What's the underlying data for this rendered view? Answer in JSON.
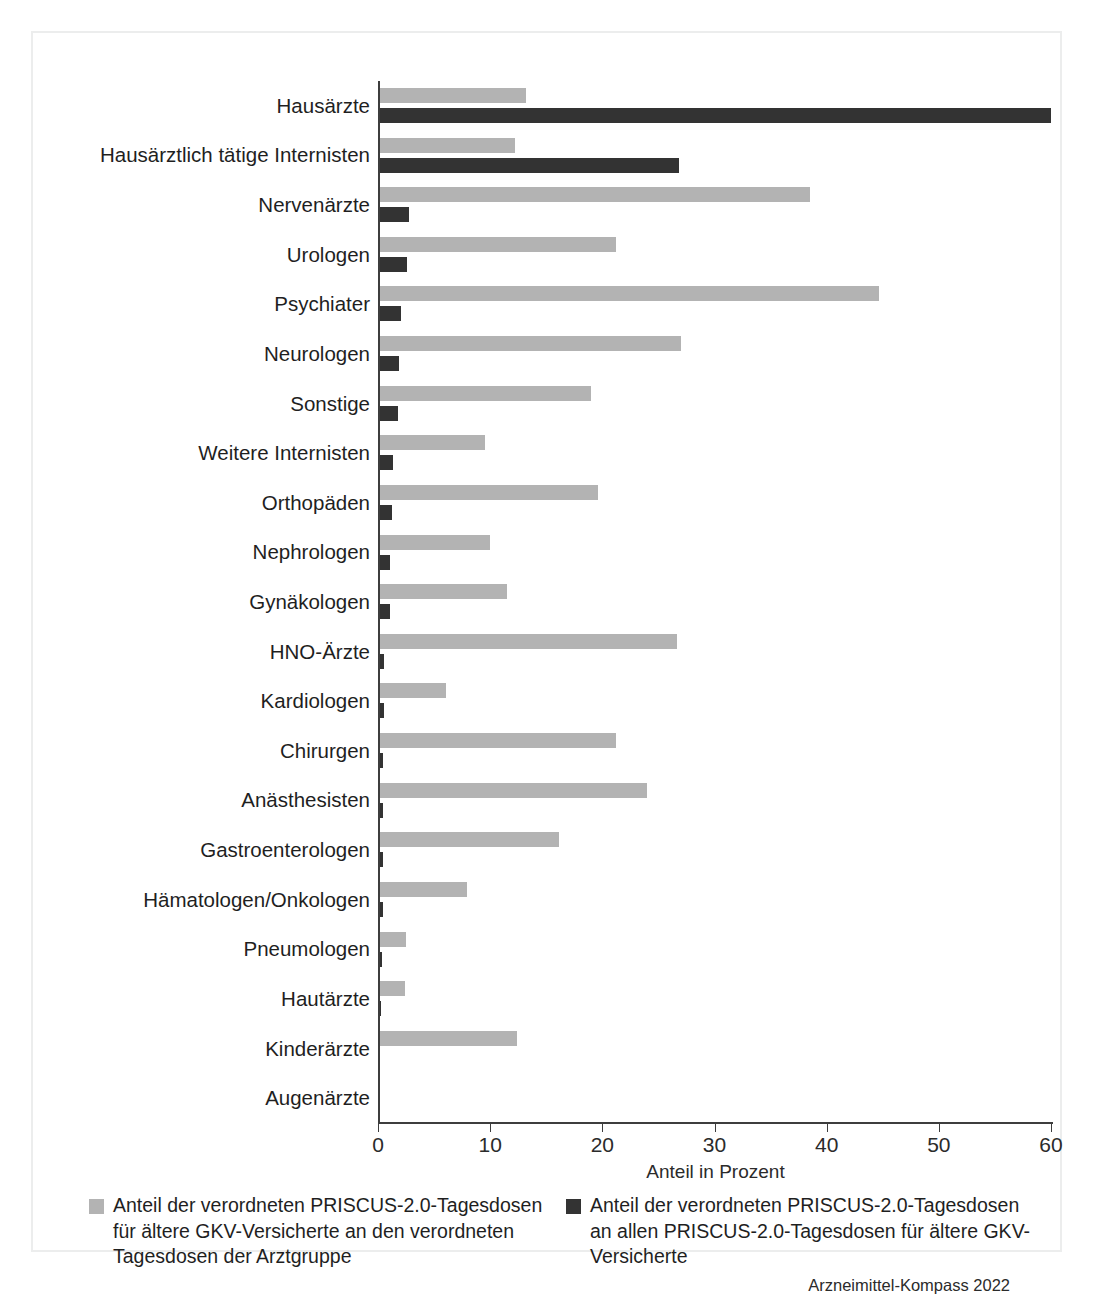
{
  "chart_data": {
    "type": "bar",
    "orientation": "horizontal",
    "title": "",
    "xlabel": "Anteil in Prozent",
    "ylabel": "",
    "xlim": [
      0,
      60
    ],
    "xticks": [
      0,
      10,
      20,
      30,
      40,
      50,
      60
    ],
    "grid": false,
    "legend_position": "bottom",
    "categories": [
      "Hausärzte",
      "Hausärztlich tätige Internisten",
      "Nervenärzte",
      "Urologen",
      "Psychiater",
      "Neurologen",
      "Sonstige",
      "Weitere Internisten",
      "Orthopäden",
      "Nephrologen",
      "Gynäkologen",
      "HNO-Ärzte",
      "Kardiologen",
      "Chirurgen",
      "Anästhesisten",
      "Gastroenterologen",
      "Hämatologen/Onkologen",
      "Pneumologen",
      "Hautärzte",
      "Kinderärzte",
      "Augenärzte"
    ],
    "series": [
      {
        "name": "Anteil der verordneten PRISCUS-2.0-Tagesdosen für ältere GKV-Versicherte an den verordneten Tagesdosen der Arztgruppe",
        "color": "#b3b3b3",
        "values": [
          13.0,
          12.0,
          38.3,
          21.0,
          44.5,
          26.8,
          18.8,
          9.4,
          19.4,
          9.8,
          11.3,
          26.5,
          5.9,
          21.0,
          23.8,
          16.0,
          7.8,
          2.3,
          2.2,
          12.2,
          0.0
        ]
      },
      {
        "name": "Anteil der verordneten PRISCUS-2.0-Tagesdosen an allen PRISCUS-2.0-Tagesdosen für ältere GKV-Versicherte",
        "color": "#333333",
        "values": [
          59.8,
          26.7,
          2.6,
          2.4,
          1.9,
          1.7,
          1.6,
          1.2,
          1.1,
          0.9,
          0.85,
          0.4,
          0.35,
          0.3,
          0.3,
          0.25,
          0.25,
          0.15,
          0.05,
          0.0,
          0.0
        ]
      }
    ]
  },
  "axis": {
    "x_title": "Anteil in Prozent",
    "tick_labels": [
      "0",
      "10",
      "20",
      "30",
      "40",
      "50",
      "60"
    ]
  },
  "legend": {
    "entries": [
      {
        "swatch": "light-gray-swatch",
        "label": "Anteil der verordneten PRISCUS-2.0-Tagesdosen für ältere GKV-Versicherte an den verordneten Tagesdosen der Arztgruppe"
      },
      {
        "swatch": "dark-swatch",
        "label": "Anteil der verordneten PRISCUS-2.0-Tagesdosen an allen PRISCUS-2.0-Tagesdosen für ältere GKV-Versicherte"
      }
    ]
  },
  "source": "Arzneimittel-Kompass 2022",
  "colors": {
    "series_light": "#b3b3b3",
    "series_dark": "#333333",
    "axis": "#3d3d3d",
    "frame": "#eceded",
    "text": "#1f1f1f"
  }
}
